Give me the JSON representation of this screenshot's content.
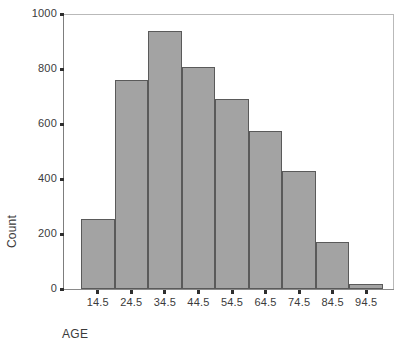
{
  "chart_data": {
    "type": "bar",
    "title": "",
    "subtitle": "",
    "xlabel": "AGE",
    "ylabel": "Count",
    "categories": [
      "14.5",
      "24.5",
      "34.5",
      "44.5",
      "54.5",
      "64.5",
      "74.5",
      "84.5",
      "94.5"
    ],
    "values": [
      255,
      760,
      940,
      808,
      692,
      573,
      430,
      170,
      20
    ],
    "xlim": [
      9.5,
      99.5
    ],
    "ylim": [
      0,
      1000
    ],
    "y_ticks": [
      "0",
      "200",
      "400",
      "600",
      "800",
      "1000"
    ],
    "y_tick_values": [
      0,
      200,
      400,
      600,
      800,
      1000
    ],
    "x_ticks": [
      "14.5",
      "24.5",
      "34.5",
      "44.5",
      "54.5",
      "64.5",
      "74.5",
      "84.5",
      "94.5"
    ],
    "grid": false,
    "legend": null,
    "legend_position": "none",
    "annotations": [],
    "bar_fill_color": "#a3a3a3",
    "bar_edge_color": "#5a5a5a",
    "axis_color": "#7d7d7d",
    "frame_color": "#b9b9b9",
    "text_color": "#3b3b3b",
    "background_color": "#ffffff"
  }
}
